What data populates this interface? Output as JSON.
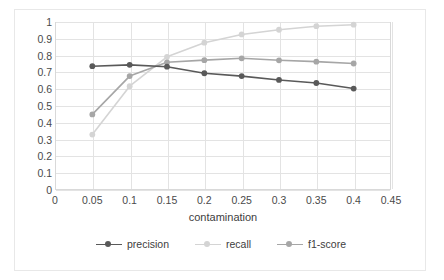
{
  "chart_data": {
    "type": "line",
    "title": "",
    "xlabel": "contamination",
    "ylabel": "",
    "xlim": [
      0,
      0.45
    ],
    "ylim": [
      0,
      1
    ],
    "grid": true,
    "legend_position": "bottom",
    "x": [
      0.05,
      0.1,
      0.15,
      0.2,
      0.25,
      0.3,
      0.35,
      0.4
    ],
    "xticks": [
      "0",
      "0.05",
      "0.1",
      "0.15",
      "0.2",
      "0.25",
      "0.3",
      "0.35",
      "0.4",
      "0.45"
    ],
    "xtick_values": [
      0,
      0.05,
      0.1,
      0.15,
      0.2,
      0.25,
      0.3,
      0.35,
      0.4,
      0.45
    ],
    "yticks": [
      "0",
      "0.1",
      "0.2",
      "0.3",
      "0.4",
      "0.5",
      "0.6",
      "0.7",
      "0.8",
      "0.9",
      "1"
    ],
    "ytick_values": [
      0,
      0.1,
      0.2,
      0.3,
      0.4,
      0.5,
      0.6,
      0.7,
      0.8,
      0.9,
      1
    ],
    "series": [
      {
        "name": "precision",
        "color": "#595959",
        "values": [
          0.737,
          0.745,
          0.734,
          0.695,
          0.678,
          0.655,
          0.637,
          0.604
        ]
      },
      {
        "name": "recall",
        "color": "#d4d4d4",
        "values": [
          0.33,
          0.618,
          0.793,
          0.877,
          0.926,
          0.954,
          0.975,
          0.984
        ]
      },
      {
        "name": "f1-score",
        "color": "#a6a6a6",
        "values": [
          0.45,
          0.678,
          0.76,
          0.773,
          0.784,
          0.772,
          0.764,
          0.753
        ]
      }
    ]
  },
  "legend": {
    "items": [
      {
        "label": "precision",
        "color": "#595959"
      },
      {
        "label": "recall",
        "color": "#d4d4d4"
      },
      {
        "label": "f1-score",
        "color": "#a6a6a6"
      }
    ]
  }
}
